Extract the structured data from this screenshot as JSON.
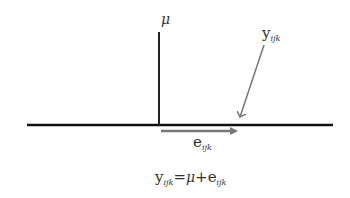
{
  "diagram": {
    "mu_label": "μ",
    "y_label": {
      "base": "y",
      "subscript": "ijk"
    },
    "e_label": {
      "base": "e",
      "subscript": "ijk"
    },
    "equation": {
      "lhs_base": "y",
      "lhs_sub": "ijk",
      "eq": "=",
      "mu": "μ",
      "plus": "+",
      "rhs_base": "e",
      "rhs_sub": "ijk"
    },
    "colors": {
      "axis": "#111111",
      "arrow": "#777777",
      "text": "#333333"
    }
  }
}
